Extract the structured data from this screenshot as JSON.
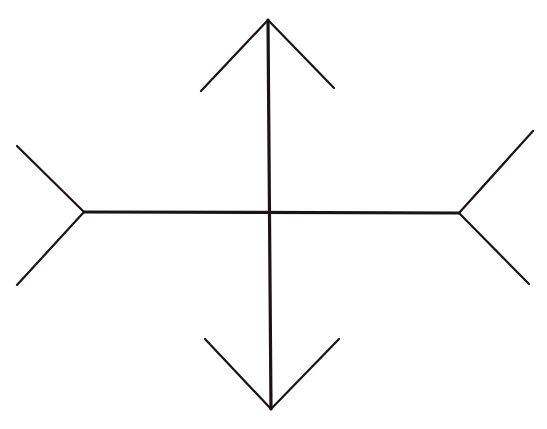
{
  "figure": {
    "name": "Müller-Lyer illusion",
    "background": "#ffffff",
    "stroke_color": "#1a1414",
    "shaft_width": 3.2,
    "fin_width": 2.2,
    "vertical": {
      "start": [
        268,
        20
      ],
      "end": [
        271,
        409
      ],
      "top_arrow": {
        "tip": [
          268,
          20
        ],
        "left": [
          201,
          91
        ],
        "right": [
          334,
          88
        ]
      },
      "bottom_arrow": {
        "tip": [
          271,
          409
        ],
        "left": [
          205,
          339
        ],
        "right": [
          339,
          339
        ]
      }
    },
    "horizontal": {
      "start": [
        84,
        212
      ],
      "end": [
        459,
        213
      ],
      "left_fins": {
        "vertex": [
          84,
          212
        ],
        "upper": [
          17,
          146
        ],
        "lower": [
          17,
          285
        ]
      },
      "right_fins": {
        "vertex": [
          459,
          213
        ],
        "upper": [
          533,
          131
        ],
        "lower": [
          529,
          284
        ]
      }
    }
  }
}
